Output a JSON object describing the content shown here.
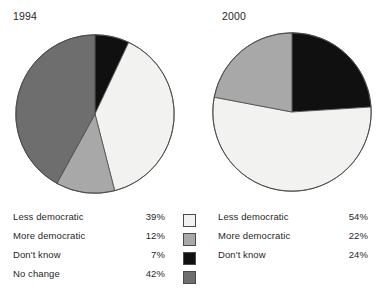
{
  "chart_data": [
    {
      "type": "pie",
      "title": "1994",
      "categories": [
        "Less democratic",
        "More democratic",
        "Don't know",
        "No change"
      ],
      "values": [
        39,
        12,
        7,
        42
      ],
      "value_labels": [
        "39%",
        "12%",
        "7%",
        "42%"
      ],
      "colors": [
        "#f2f2f1",
        "#a8a8a8",
        "#101010",
        "#6e6e6e"
      ],
      "start_angle_deg": 0,
      "direction": "clockwise",
      "slice_order": [
        "Don't know",
        "Less democratic",
        "More democratic",
        "No change"
      ],
      "legend_position": "below",
      "grid": false
    },
    {
      "type": "pie",
      "title": "2000",
      "categories": [
        "Less democratic",
        "More democratic",
        "Don't know"
      ],
      "values": [
        54,
        22,
        24
      ],
      "value_labels": [
        "54%",
        "22%",
        "24%"
      ],
      "colors": [
        "#f2f2f1",
        "#a8a8a8",
        "#101010"
      ],
      "start_angle_deg": 0,
      "direction": "clockwise",
      "slice_order": [
        "Don't know",
        "Less democratic",
        "More democratic"
      ],
      "legend_position": "below",
      "grid": false
    }
  ],
  "charts": {
    "left": {
      "year": "1994",
      "legend": [
        {
          "label": "Less democratic",
          "value": "39%"
        },
        {
          "label": "More democratic",
          "value": "12%"
        },
        {
          "label": "Don't know",
          "value": "7%"
        },
        {
          "label": "No change",
          "value": "42%"
        }
      ]
    },
    "right": {
      "year": "2000",
      "legend": [
        {
          "label": "Less democratic",
          "value": "54%"
        },
        {
          "label": "More democratic",
          "value": "22%"
        },
        {
          "label": "Don't know",
          "value": "24%"
        }
      ]
    }
  },
  "swatches": [
    {
      "name": "less-democratic",
      "color": "#f2f2f1"
    },
    {
      "name": "more-democratic",
      "color": "#a8a8a8"
    },
    {
      "name": "dont-know",
      "color": "#101010"
    },
    {
      "name": "no-change",
      "color": "#6e6e6e"
    }
  ],
  "palette": {
    "less_democratic": "#f2f2f1",
    "more_democratic": "#a8a8a8",
    "dont_know": "#101010",
    "no_change": "#6e6e6e",
    "outline": "#4a4a4a",
    "text": "#1f1f1f",
    "background": "#ffffff"
  }
}
